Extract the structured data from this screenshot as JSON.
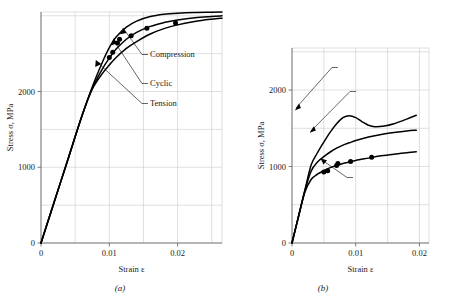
{
  "figure": {
    "panels": [
      {
        "caption": "(a)",
        "axes": {
          "xlabel": "Strain ε",
          "ylabel": "Stress σ, MPa",
          "xticks": [
            "0",
            "0.01",
            "0.02"
          ],
          "xtickvals": [
            0,
            0.01,
            0.02
          ],
          "yticks": [
            "0",
            "1000",
            "2000"
          ],
          "ytickvals": [
            0,
            1000,
            2000
          ],
          "xlim": [
            0,
            0.0265
          ],
          "ylim": [
            0,
            3050
          ]
        },
        "annotations": [
          {
            "label": "Compression",
            "x": 150,
            "y": 57
          },
          {
            "label": "Cyclic",
            "x": 150,
            "y": 86
          },
          {
            "label": "Tension",
            "x": 150,
            "y": 106
          }
        ]
      },
      {
        "caption": "(b)",
        "axes": {
          "xlabel": "Strain ε",
          "ylabel": "Stress σ, MPa",
          "xticks": [
            "0",
            "0.01",
            "0.02"
          ],
          "xtickvals": [
            0,
            0.01,
            0.02
          ],
          "yticks": [
            "0",
            "1000",
            "2000"
          ],
          "ytickvals": [
            0,
            1000,
            2000
          ],
          "xlim": [
            0,
            0.0215
          ],
          "ylim": [
            0,
            2550
          ]
        },
        "annotations": [
          {
            "label": "Tension",
            "x": 340,
            "y": 70
          },
          {
            "label": "Compression",
            "x": 358,
            "y": 94
          },
          {
            "label": "Cyclic",
            "x": 355,
            "y": 180
          }
        ]
      }
    ]
  },
  "chart_data": [
    {
      "type": "line",
      "panel": "(a)",
      "title": "",
      "xlabel": "Strain ε",
      "ylabel": "Stress σ, MPa",
      "xlim": [
        0,
        0.0265
      ],
      "ylim": [
        0,
        3050
      ],
      "xticks": [
        0,
        0.01,
        0.02
      ],
      "yticks": [
        0,
        1000,
        2000
      ],
      "grid": true,
      "legend": "inline-annotations",
      "series": [
        {
          "name": "Compression",
          "x": [
            0,
            0.002,
            0.004,
            0.006,
            0.0075,
            0.009,
            0.01,
            0.011,
            0.0125,
            0.014,
            0.016,
            0.018,
            0.02,
            0.0225,
            0.025,
            0.0265
          ],
          "y": [
            0,
            560,
            1120,
            1680,
            2060,
            2390,
            2580,
            2720,
            2850,
            2930,
            2990,
            3020,
            3035,
            3045,
            3048,
            3050
          ]
        },
        {
          "name": "Cyclic",
          "x": [
            0,
            0.002,
            0.004,
            0.006,
            0.0075,
            0.009,
            0.01,
            0.011,
            0.0125,
            0.014,
            0.016,
            0.018,
            0.02,
            0.0225,
            0.025,
            0.0265
          ],
          "y": [
            0,
            560,
            1120,
            1680,
            2040,
            2300,
            2440,
            2560,
            2690,
            2780,
            2860,
            2910,
            2945,
            2975,
            2992,
            3000
          ]
        },
        {
          "name": "Tension",
          "x": [
            0,
            0.002,
            0.004,
            0.006,
            0.0075,
            0.009,
            0.01,
            0.011,
            0.0125,
            0.014,
            0.016,
            0.018,
            0.02,
            0.0225,
            0.025,
            0.0265
          ],
          "y": [
            0,
            560,
            1120,
            1680,
            2030,
            2240,
            2350,
            2450,
            2570,
            2660,
            2760,
            2830,
            2880,
            2925,
            2955,
            2968
          ]
        }
      ],
      "markers": [
        {
          "x": 0.01,
          "y": 2450,
          "series": "Cyclic"
        },
        {
          "x": 0.0105,
          "y": 2520,
          "series": "Cyclic"
        },
        {
          "x": 0.0112,
          "y": 2640,
          "series": "Cyclic"
        },
        {
          "x": 0.0115,
          "y": 2690,
          "series": "Cyclic"
        },
        {
          "x": 0.0132,
          "y": 2735,
          "series": "Cyclic"
        },
        {
          "x": 0.0155,
          "y": 2835,
          "series": "Cyclic"
        },
        {
          "x": 0.0197,
          "y": 2905,
          "series": "Cyclic"
        }
      ]
    },
    {
      "type": "line",
      "panel": "(b)",
      "title": "",
      "xlabel": "Strain ε",
      "ylabel": "Stress σ, MPa",
      "xlim": [
        0,
        0.0215
      ],
      "ylim": [
        0,
        2550
      ],
      "xticks": [
        0,
        0.01,
        0.02
      ],
      "yticks": [
        0,
        1000,
        2000
      ],
      "grid": true,
      "legend": "inline-annotations",
      "series": [
        {
          "name": "Tension",
          "x": [
            0,
            0.001,
            0.002,
            0.003,
            0.004,
            0.005,
            0.006,
            0.007,
            0.008,
            0.009,
            0.01,
            0.011,
            0.012,
            0.013,
            0.0145,
            0.016,
            0.018,
            0.0195
          ],
          "y": [
            0,
            340,
            680,
            1020,
            1180,
            1320,
            1450,
            1560,
            1640,
            1665,
            1640,
            1585,
            1540,
            1520,
            1530,
            1560,
            1620,
            1670
          ]
        },
        {
          "name": "Compression",
          "x": [
            0,
            0.001,
            0.002,
            0.003,
            0.004,
            0.005,
            0.006,
            0.007,
            0.008,
            0.009,
            0.01,
            0.012,
            0.014,
            0.016,
            0.018,
            0.0195
          ],
          "y": [
            0,
            340,
            680,
            940,
            1060,
            1130,
            1190,
            1240,
            1280,
            1310,
            1340,
            1385,
            1420,
            1445,
            1465,
            1475
          ]
        },
        {
          "name": "Cyclic",
          "x": [
            0,
            0.001,
            0.002,
            0.003,
            0.004,
            0.005,
            0.006,
            0.007,
            0.008,
            0.009,
            0.01,
            0.012,
            0.014,
            0.016,
            0.018,
            0.0195
          ],
          "y": [
            0,
            340,
            660,
            830,
            900,
            945,
            985,
            1015,
            1040,
            1060,
            1080,
            1110,
            1140,
            1162,
            1180,
            1192
          ]
        }
      ],
      "markers": [
        {
          "x": 0.005,
          "y": 930,
          "series": "Cyclic"
        },
        {
          "x": 0.0056,
          "y": 945,
          "series": "Cyclic"
        },
        {
          "x": 0.007,
          "y": 1015,
          "series": "Cyclic"
        },
        {
          "x": 0.0072,
          "y": 1040,
          "series": "Cyclic"
        },
        {
          "x": 0.0092,
          "y": 1065,
          "series": "Cyclic"
        },
        {
          "x": 0.0125,
          "y": 1120,
          "series": "Cyclic"
        }
      ]
    }
  ]
}
